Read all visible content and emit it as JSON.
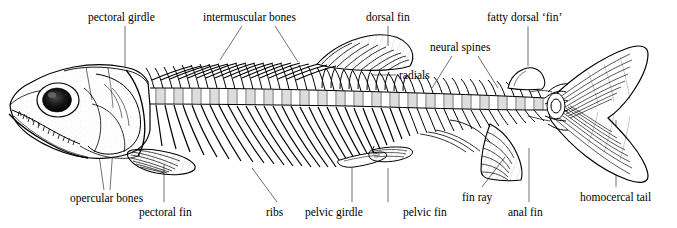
{
  "figure": {
    "background_color": "#ffffff",
    "ink_color": "#000000"
  },
  "labels": [
    {
      "id": "pectoral-girdle",
      "text": "pectoral girdle",
      "x": 88,
      "y": 12
    },
    {
      "id": "intermuscular-bones",
      "text": "intermuscular bones",
      "x": 203,
      "y": 12
    },
    {
      "id": "dorsal-fin",
      "text": "dorsal fin",
      "x": 366,
      "y": 12
    },
    {
      "id": "fatty-dorsal-fin",
      "text": "fatty dorsal ‘fin’",
      "x": 487,
      "y": 12
    },
    {
      "id": "neural-spines",
      "text": "neural spines",
      "x": 430,
      "y": 42
    },
    {
      "id": "radials",
      "text": "radials",
      "x": 399,
      "y": 70
    },
    {
      "id": "opercular-bones",
      "text": "opercular bones",
      "x": 70,
      "y": 193
    },
    {
      "id": "pectoral-fin",
      "text": "pectoral fin",
      "x": 139,
      "y": 207
    },
    {
      "id": "ribs",
      "text": "ribs",
      "x": 266,
      "y": 207
    },
    {
      "id": "pelvic-girdle",
      "text": "pelvic girdle",
      "x": 305,
      "y": 207
    },
    {
      "id": "pelvic-fin",
      "text": "pelvic fin",
      "x": 403,
      "y": 207
    },
    {
      "id": "fin-ray",
      "text": "fin ray",
      "x": 462,
      "y": 192
    },
    {
      "id": "anal-fin",
      "text": "anal fin",
      "x": 508,
      "y": 207
    },
    {
      "id": "homocercal-tail",
      "text": "homocercal tail",
      "x": 580,
      "y": 192
    }
  ]
}
